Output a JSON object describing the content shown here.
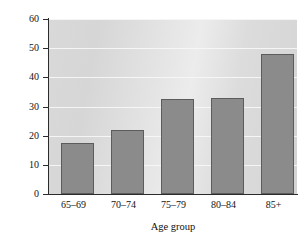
{
  "chart_data": {
    "type": "bar",
    "title": "",
    "xlabel": "Age group",
    "ylabel": "Percentage",
    "categories": [
      "65–69",
      "70–74",
      "75–79",
      "80–84",
      "85+"
    ],
    "values": [
      17.5,
      22.0,
      32.5,
      33.0,
      48.0
    ],
    "ylim": [
      0,
      60
    ],
    "ytick_labels": [
      "0",
      "10",
      "20",
      "30",
      "40",
      "50",
      "60"
    ],
    "ytick_values": [
      0,
      10,
      20,
      30,
      40,
      50,
      60
    ],
    "grid": "horizontal-white",
    "legend": "none",
    "bar_color": "#8b8b8b",
    "bar_edge_color": "#5c5c5c",
    "plot_background": "#dcdcdc",
    "page_background": "#ffffff",
    "axis_color": "#2b2b2b"
  }
}
